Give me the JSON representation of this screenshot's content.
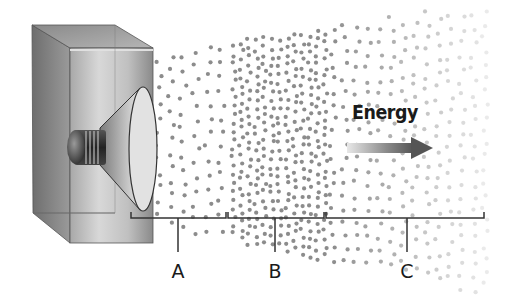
{
  "diagram": {
    "energy_label": "Energy",
    "labels": [
      {
        "id": "A",
        "text": "A",
        "x": 178
      },
      {
        "id": "B",
        "text": "B",
        "x": 275
      },
      {
        "id": "C",
        "text": "C",
        "x": 407
      }
    ],
    "brackets": [
      {
        "x1": 131,
        "x2": 226
      },
      {
        "x1": 228,
        "x2": 324
      },
      {
        "x1": 326,
        "x2": 484
      }
    ],
    "bracket_y": 218,
    "tick_bottom_y": 252,
    "label_top_y": 262,
    "colors": {
      "dot": "#8c8c8c",
      "line": "#333333",
      "text": "#1a1a1a",
      "arrow_start": "#e6e6e6",
      "arrow_end": "#5a5a5a"
    }
  }
}
